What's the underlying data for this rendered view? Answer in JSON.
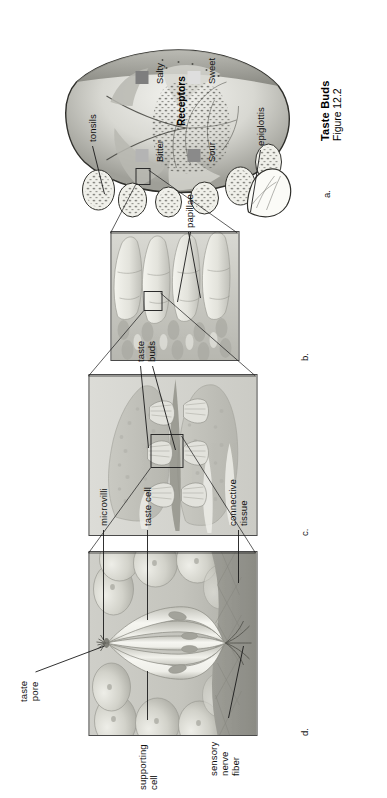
{
  "figure": {
    "title": "Taste Buds",
    "subtitle": "Figure 12.2"
  },
  "panels": [
    {
      "letter": "a.",
      "name": "tongue-overview"
    },
    {
      "letter": "b.",
      "name": "papillae-detail"
    },
    {
      "letter": "c.",
      "name": "taste-bud-section"
    },
    {
      "letter": "d.",
      "name": "taste-bud-closeup"
    }
  ],
  "labels": {
    "taste_pore": "taste\npore",
    "supporting_cell": "supporting\ncell",
    "sensory_nerve_fiber": "sensory\nnerve\nfiber",
    "microvilli": "microvilli",
    "taste_cell": "taste cell",
    "connective_tissue": "connective\ntissue",
    "taste_buds": "taste\nbuds",
    "papillae": "papillae",
    "tonsils": "tonsils",
    "epiglottis": "epiglottis"
  },
  "legend": {
    "title": "Receptors",
    "items": [
      {
        "label": "Bitter",
        "color": "#b4b4b4"
      },
      {
        "label": "Sour",
        "color": "#8a8a8a"
      },
      {
        "label": "Salty",
        "color": "#7e7e7e"
      },
      {
        "label": "Sweet",
        "color": "#dedede"
      }
    ]
  }
}
